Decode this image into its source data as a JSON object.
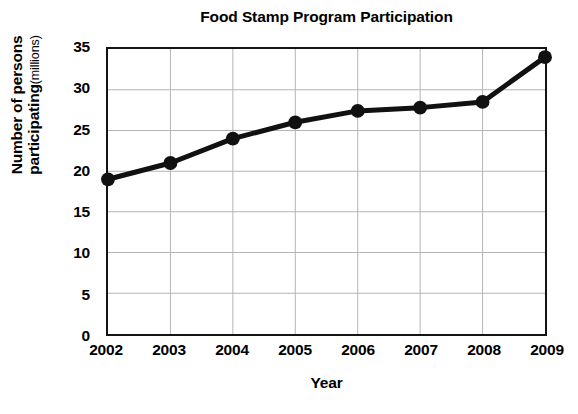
{
  "chart_data": {
    "type": "line",
    "title": "Food Stamp Program Participation",
    "xlabel": "Year",
    "ylabel": "Number of persons participating",
    "ylabel_line1": "Number of persons",
    "ylabel_line2": "participating",
    "yunit": "(millions)",
    "categories": [
      "2002",
      "2003",
      "2004",
      "2005",
      "2006",
      "2007",
      "2008",
      "2009"
    ],
    "values": [
      19,
      21,
      24,
      26,
      27.4,
      27.8,
      28.5,
      34
    ],
    "series": [
      {
        "name": "Number of persons participating (millions)",
        "values": [
          19,
          21,
          24,
          26,
          27.4,
          27.8,
          28.5,
          34
        ]
      }
    ],
    "ylim": [
      0,
      35
    ],
    "yticks": [
      0,
      5,
      10,
      15,
      20,
      25,
      30,
      35
    ],
    "ytick_labels": [
      "0",
      "5",
      "10",
      "15",
      "20",
      "25",
      "30",
      "35"
    ],
    "grid": true,
    "legend": "none",
    "line_color": "#111111",
    "marker": "circle",
    "marker_color": "#111111",
    "grid_color": "#b4b4b4",
    "frame_color": "#141414",
    "background": "#ffffff"
  }
}
